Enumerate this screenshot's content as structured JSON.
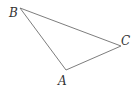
{
  "diagram": {
    "type": "triangle",
    "stroke_color": "#6e6e6e",
    "label_color": "#333333",
    "vertices": [
      {
        "name": "A",
        "label": "A",
        "x": 66,
        "y": 70,
        "label_x": 58,
        "label_y": 85
      },
      {
        "name": "B",
        "label": "B",
        "x": 20,
        "y": 8,
        "label_x": 9,
        "label_y": 17
      },
      {
        "name": "C",
        "label": "C",
        "x": 121,
        "y": 46,
        "label_x": 121,
        "label_y": 45
      }
    ],
    "edges": [
      {
        "from": "B",
        "to": "C"
      },
      {
        "from": "C",
        "to": "A"
      },
      {
        "from": "A",
        "to": "B"
      }
    ]
  }
}
